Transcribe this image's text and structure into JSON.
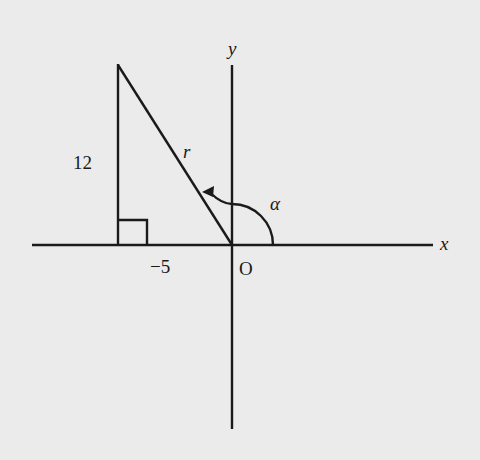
{
  "diagram": {
    "type": "coordinate-plane-right-triangle",
    "background": "#ebebeb",
    "line_color": "#1a1a1a",
    "axes": {
      "x_label": "x",
      "y_label": "y",
      "origin_label": "O"
    },
    "triangle": {
      "vertical_side_label": "12",
      "horizontal_side_label": "−5",
      "hypotenuse_label": "r",
      "right_angle_marker": true
    },
    "angle": {
      "label": "α",
      "from": "positive x-axis",
      "to": "terminal side r",
      "direction": "counterclockwise"
    },
    "points": {
      "origin": [
        0,
        0
      ],
      "terminal_point": [
        -5,
        12
      ]
    }
  }
}
